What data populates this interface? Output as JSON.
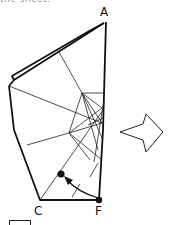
{
  "caption": {
    "partial_text": "the sheet."
  },
  "diagram": {
    "type": "origami-fold-step",
    "points": {
      "A": "A",
      "C": "C",
      "F": "F"
    },
    "arrow_direction": "right",
    "fold_instruction": "Fold corner F up to the marked dot",
    "colors": {
      "line": "#111111",
      "background": "#ffffff"
    }
  }
}
